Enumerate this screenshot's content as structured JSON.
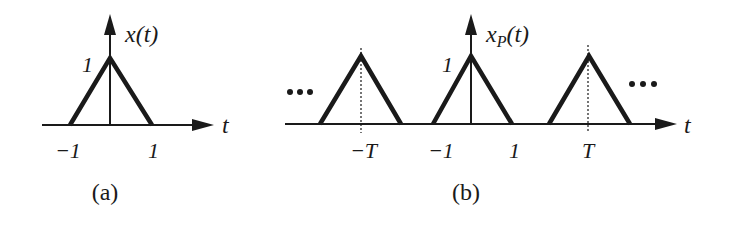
{
  "panel_a": {
    "caption": "(a)",
    "function_label": "x(t)",
    "axis_label": "t",
    "peak_label": "1",
    "ticks": [
      "−1",
      "1"
    ],
    "pulse": {
      "shape": "triangle",
      "center": 0,
      "half_width": 1,
      "height": 1
    }
  },
  "panel_b": {
    "caption": "(b)",
    "function_label_main": "x",
    "function_label_sub": "P",
    "function_label_arg": "(t)",
    "axis_label": "t",
    "peak_label": "1",
    "ticks": [
      "−T",
      "−1",
      "1",
      "T"
    ],
    "ellipsis_left": "···",
    "ellipsis_right": "···",
    "pulses": [
      {
        "center": "−T",
        "half_width": 1,
        "height": 1
      },
      {
        "center": "0",
        "half_width": 1,
        "height": 1
      },
      {
        "center": "T",
        "half_width": 1,
        "height": 1
      }
    ]
  },
  "colors": {
    "ink": "#1a1a1a",
    "background": "#ffffff"
  }
}
